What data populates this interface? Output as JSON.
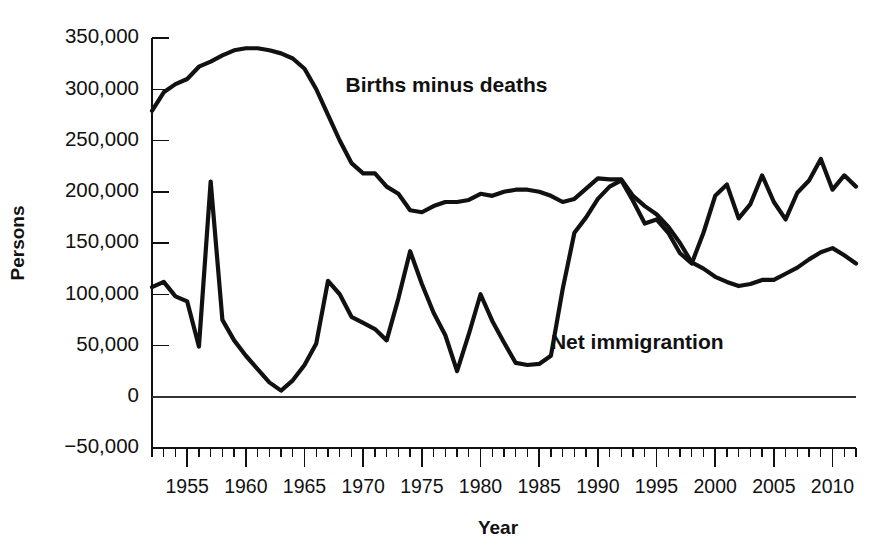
{
  "chart_data": {
    "type": "line",
    "title": "",
    "xlabel": "Year",
    "ylabel": "Persons",
    "xlim": [
      1952,
      2012
    ],
    "ylim": [
      -50000,
      350000
    ],
    "ytick_values": [
      350000,
      300000,
      250000,
      200000,
      150000,
      100000,
      50000,
      0,
      -50000
    ],
    "ytick_labels": [
      "350,000",
      "300,000",
      "250,000",
      "200,000",
      "150,000",
      "100,000",
      "50,000",
      "0",
      "−50,000"
    ],
    "xtick_major": [
      1955,
      1960,
      1965,
      1970,
      1975,
      1980,
      1985,
      1990,
      1995,
      2000,
      2005,
      2010
    ],
    "xtick_labels": [
      "1955",
      "1960",
      "1965",
      "1970",
      "1975",
      "1980",
      "1985",
      "1990",
      "1995",
      "2000",
      "2005",
      "2010"
    ],
    "xtick_minor_step": 1,
    "grid": false,
    "legend_position": "inline-annotation",
    "annotations": [
      {
        "text": "Births minus deaths",
        "x": 1968.5,
        "y": 297000
      },
      {
        "text": "Net immigrantion",
        "x": 1986.0,
        "y": 47000
      }
    ],
    "x": [
      1952,
      1953,
      1954,
      1955,
      1956,
      1957,
      1958,
      1959,
      1960,
      1961,
      1962,
      1963,
      1964,
      1965,
      1966,
      1967,
      1968,
      1969,
      1970,
      1971,
      1972,
      1973,
      1974,
      1975,
      1976,
      1977,
      1978,
      1979,
      1980,
      1981,
      1982,
      1983,
      1984,
      1985,
      1986,
      1987,
      1988,
      1989,
      1990,
      1991,
      1992,
      1993,
      1994,
      1995,
      1996,
      1997,
      1998,
      1999,
      2000,
      2001,
      2002,
      2003,
      2004,
      2005,
      2006,
      2007,
      2008,
      2009,
      2010,
      2011,
      2012
    ],
    "series": [
      {
        "name": "Births minus deaths",
        "values": [
          279000,
          297000,
          305000,
          310000,
          322000,
          327000,
          333000,
          338000,
          340000,
          340000,
          338000,
          335000,
          330000,
          320000,
          300000,
          275000,
          250000,
          228000,
          218000,
          218000,
          205000,
          198000,
          182000,
          180000,
          186000,
          190000,
          190000,
          192000,
          198000,
          196000,
          200000,
          202000,
          202000,
          200000,
          196000,
          190000,
          193000,
          203000,
          213000,
          212000,
          212000,
          196000,
          186000,
          178000,
          166000,
          150000,
          131000,
          125000,
          117000,
          112000,
          108000,
          110000,
          114000,
          114000,
          120000,
          126000,
          134000,
          141000,
          145000,
          138000,
          130000
        ]
      },
      {
        "name": "Net immigrantion",
        "values": [
          107000,
          112000,
          98000,
          93000,
          49000,
          210000,
          75000,
          55000,
          40000,
          27000,
          14000,
          6000,
          16000,
          31000,
          52000,
          113000,
          100000,
          78000,
          72000,
          66000,
          55000,
          96000,
          142000,
          110000,
          82000,
          60000,
          25000,
          61000,
          100000,
          74000,
          53000,
          33000,
          31000,
          32000,
          40000,
          105000,
          160000,
          175000,
          193000,
          205000,
          211000,
          191000,
          169000,
          173000,
          160000,
          140000,
          130000,
          160000,
          196000,
          207000,
          174000,
          188000,
          216000,
          190000,
          173000,
          199000,
          211000,
          232000,
          202000,
          216000,
          205000
        ]
      }
    ]
  },
  "labels": {
    "y_axis_title": "Persons",
    "x_axis_title": "Year",
    "series_births": "Births minus deaths",
    "series_immigration": "Net immigrantion"
  },
  "colors": {
    "line": "#111111",
    "axis": "#111111",
    "background": "#ffffff"
  }
}
